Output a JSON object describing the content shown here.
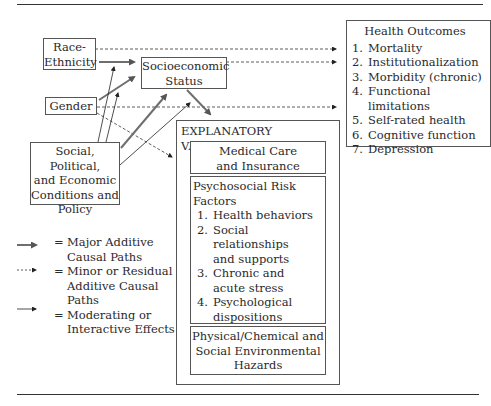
{
  "diagram": {
    "nodes": {
      "race": {
        "label": "Race-\nEthnicity",
        "line1": "Race-",
        "line2": "Ethnicity"
      },
      "gender": {
        "label": "Gender"
      },
      "social": {
        "line1": "Social, Political,",
        "line2": "and Economic",
        "line3": "Conditions and",
        "line4": "Policy"
      },
      "ses": {
        "line1": "Socioeconomic",
        "line2": "Status"
      },
      "explanatory": {
        "title": "EXPLANATORY VARIABLES",
        "medical": {
          "line1": "Medical Care",
          "line2": "and Insurance"
        },
        "psychosocial": {
          "title": "Psychosocial Risk Factors",
          "items": [
            {
              "num": "1.",
              "line1": "Health behaviors",
              "line2": ""
            },
            {
              "num": "2.",
              "line1": "Social relationships",
              "line2": "and supports"
            },
            {
              "num": "3.",
              "line1": "Chronic and",
              "line2": "acute stress"
            },
            {
              "num": "4.",
              "line1": "Psychological",
              "line2": "dispositions"
            },
            {
              "num": "5.",
              "line1": "Social roles and",
              "line2": "productive activities"
            }
          ]
        },
        "hazards": {
          "line1": "Physical/Chemical and",
          "line2": "Social Environmental",
          "line3": "Hazards"
        }
      },
      "outcomes": {
        "title": "Health Outcomes",
        "items": [
          {
            "num": "1.",
            "label": "Mortality"
          },
          {
            "num": "2.",
            "label": "Institutionalization"
          },
          {
            "num": "3.",
            "label": "Morbidity (chronic)"
          },
          {
            "num": "4.",
            "label": "Functional limitations"
          },
          {
            "num": "5.",
            "label": "Self-rated health"
          },
          {
            "num": "6.",
            "label": "Cognitive function"
          },
          {
            "num": "7.",
            "label": "Depression"
          }
        ]
      }
    },
    "legend": [
      {
        "type": "major",
        "line1": "Major Additive",
        "line2": "Causal Paths",
        "line3": ""
      },
      {
        "type": "minor",
        "line1": "Minor or Residual",
        "line2": "Additive Causal",
        "line3": "Paths"
      },
      {
        "type": "moderating",
        "line1": "Moderating or",
        "line2": "Interactive Effects",
        "line3": ""
      }
    ],
    "legend_eq": "=",
    "colors": {
      "major_arrow": "#6e6e6e",
      "line": "#333333",
      "border": "#555555"
    }
  }
}
